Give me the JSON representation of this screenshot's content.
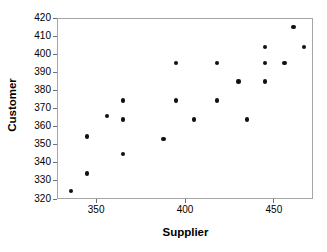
{
  "chart_data": {
    "type": "scatter",
    "title": "",
    "xlabel": "Supplier",
    "ylabel": "Customer",
    "xlim": [
      328,
      472
    ],
    "ylim": [
      320,
      420
    ],
    "xticks": [
      350,
      400,
      450
    ],
    "yticks": [
      320,
      330,
      340,
      350,
      360,
      370,
      380,
      390,
      400,
      410,
      420
    ],
    "grid": false,
    "legend": null,
    "marker": {
      "shape": "circle",
      "color": "#111111",
      "size": 4.4
    },
    "points": [
      {
        "x": 336,
        "y": 324.5
      },
      {
        "x": 345,
        "y": 334.0
      },
      {
        "x": 345,
        "y": 354.5
      },
      {
        "x": 356,
        "y": 366.0
      },
      {
        "x": 365,
        "y": 345.0
      },
      {
        "x": 365,
        "y": 364.0
      },
      {
        "x": 365,
        "y": 374.5
      },
      {
        "x": 388,
        "y": 353.0
      },
      {
        "x": 395,
        "y": 374.5
      },
      {
        "x": 395,
        "y": 395.0
      },
      {
        "x": 405,
        "y": 364.0
      },
      {
        "x": 418,
        "y": 374.5
      },
      {
        "x": 418,
        "y": 395.0
      },
      {
        "x": 430,
        "y": 385.0
      },
      {
        "x": 435,
        "y": 364.0
      },
      {
        "x": 445,
        "y": 385.0
      },
      {
        "x": 445,
        "y": 395.0
      },
      {
        "x": 445,
        "y": 404.0
      },
      {
        "x": 456,
        "y": 395.0
      },
      {
        "x": 461,
        "y": 415.0
      },
      {
        "x": 467,
        "y": 404.0
      }
    ]
  },
  "axes": {
    "y_title": "Customer",
    "x_title": "Supplier",
    "y_tick_labels": [
      "420",
      "410",
      "400",
      "390",
      "380",
      "370",
      "360",
      "350",
      "340",
      "330",
      "320"
    ],
    "x_tick_labels": [
      "350",
      "400",
      "450"
    ]
  },
  "colors": {
    "frame": "#a6a6a6",
    "tick": "#6e6e6e",
    "marker": "#111111",
    "text": "#000000",
    "background": "#ffffff"
  }
}
